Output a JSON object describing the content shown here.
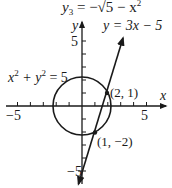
{
  "header": {
    "equation_prefix": "y",
    "equation_sub": "3",
    "equation_rest": " = −√5 − x",
    "equation_sup": "2"
  },
  "axes": {
    "x_label": "x",
    "y_label": "y",
    "x_tick_neg": "−5",
    "x_tick_pos": "5",
    "y_tick_pos": "5",
    "y_tick_neg": "−5"
  },
  "curves": {
    "line_label": "y = 3x − 5",
    "circle_label_a": "x",
    "circle_label_b": "2",
    "circle_label_c": " + y",
    "circle_label_d": "2",
    "circle_label_e": " = 5"
  },
  "points": [
    {
      "label": "(2, 1)",
      "x": 2,
      "y": 1
    },
    {
      "label": "(1, −2)",
      "x": 1,
      "y": -2
    }
  ],
  "colors": {
    "ink": "#1a1a1a",
    "background": "#ffffff"
  }
}
